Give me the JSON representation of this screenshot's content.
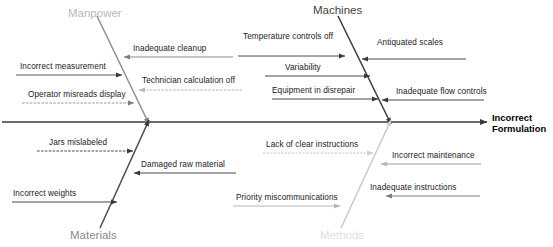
{
  "diagram": {
    "type": "fishbone-ishikawa",
    "effect": {
      "line1": "Incorrect",
      "line2": "Formulation"
    },
    "categories": [
      {
        "id": "manpower",
        "label": "Manpower",
        "position": "top-left",
        "color": "#b8b8b8",
        "causes": [
          {
            "label": "Inadequate cleanup",
            "direction": "left"
          },
          {
            "label": "Incorrect measurement",
            "direction": "right"
          },
          {
            "label": "Technician calculation off",
            "direction": "left"
          },
          {
            "label": "Operator misreads display",
            "direction": "right"
          }
        ]
      },
      {
        "id": "machines",
        "label": "Machines",
        "position": "top-right",
        "color": "#3f3f3f",
        "causes": [
          {
            "label": "Temperature controls off",
            "direction": "right"
          },
          {
            "label": "Antiquated scales",
            "direction": "left"
          },
          {
            "label": "Variability",
            "direction": "right"
          },
          {
            "label": "Equipment in disrepair",
            "direction": "right"
          },
          {
            "label": "Inadequate flow controls",
            "direction": "left"
          }
        ]
      },
      {
        "id": "materials",
        "label": "Materials",
        "position": "bottom-left",
        "color": "#8a8a8a",
        "causes": [
          {
            "label": "Jars mislabeled",
            "direction": "right"
          },
          {
            "label": "Damaged raw material",
            "direction": "left"
          },
          {
            "label": "Incorrect weights",
            "direction": "right"
          }
        ]
      },
      {
        "id": "methods",
        "label": "Methods",
        "position": "bottom-right",
        "color": "#e0e0e0",
        "causes": [
          {
            "label": "Lack of clear instructions",
            "direction": "right"
          },
          {
            "label": "Incorrect maintenance",
            "direction": "left"
          },
          {
            "label": "Inadequate instructions",
            "direction": "left"
          },
          {
            "label": "Priority miscommunications",
            "direction": "right"
          }
        ]
      }
    ]
  }
}
